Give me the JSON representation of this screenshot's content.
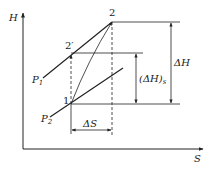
{
  "diagram": {
    "type": "H-S (enthalpy-entropy) compression diagram",
    "axes": {
      "y_label": "H",
      "x_label": "S"
    },
    "isobars": [
      {
        "label": "P",
        "subscript": "1"
      },
      {
        "label": "P",
        "subscript": "2"
      }
    ],
    "points": {
      "p1": "1",
      "p2": "2",
      "p2s": "2′"
    },
    "annotations": {
      "delta_h": "ΔH",
      "delta_h_s": "(ΔH)",
      "delta_h_s_sub": "s",
      "delta_s": "ΔS"
    },
    "colors": {
      "line": "#222222",
      "background": "#ffffff"
    }
  }
}
